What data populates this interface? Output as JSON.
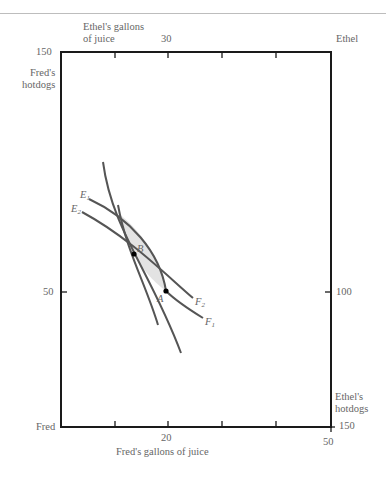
{
  "diagram": {
    "type": "edgeworth-box",
    "origins": {
      "bottom_left": "Fred",
      "top_right": "Ethel"
    },
    "axes": {
      "bottom": {
        "label": "Fred's gallons of juice",
        "tick_label": "20",
        "end_label": "50"
      },
      "top": {
        "label_line1": "Ethel's gallons",
        "label_line2": "of juice",
        "tick_label": "30"
      },
      "left": {
        "label_line1": "Fred's",
        "label_line2": "hotdogs",
        "top_label": "150",
        "tick_label": "50"
      },
      "right": {
        "label_line1": "Ethel's",
        "label_line2": "hotdogs",
        "bottom_label": "150",
        "tick_label": "100"
      }
    },
    "curves": {
      "E1": {
        "label": "E",
        "sub": "1"
      },
      "E2": {
        "label": "E",
        "sub": "2"
      },
      "F1": {
        "label": "F",
        "sub": "1"
      },
      "F2": {
        "label": "F",
        "sub": "2"
      }
    },
    "points": {
      "A": "A",
      "B": "B"
    },
    "colors": {
      "box": "#1a1a1a",
      "curve": "#555555",
      "lens_fill": "#e3e3e3",
      "text": "#666666"
    }
  }
}
